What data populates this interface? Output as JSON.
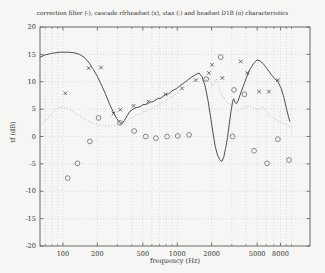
{
  "figure": {
    "title": "correction filter (-), cascade rfrheadset (x), stax (:) and headset D1B (o) characteristics",
    "xlabel": "frequency (Hz)",
    "ylabel": "tf (dB)"
  },
  "chart_data": {
    "type": "line",
    "title": "correction filter (-), cascade rfrheadset (x), stax (:) and headset D1B (o) characteristics",
    "xlabel": "frequency (Hz)",
    "ylabel": "tf (dB)",
    "x_scale": "log",
    "xlim": [
      63,
      14500
    ],
    "ylim": [
      -20,
      20
    ],
    "x_ticks": [
      100,
      200,
      500,
      1000,
      2000,
      5000,
      8000
    ],
    "x_minor_ticks": [
      70,
      80,
      90,
      300,
      400,
      600,
      700,
      800,
      900,
      3000,
      4000,
      6000,
      7000,
      9000,
      10000
    ],
    "y_ticks": [
      -20,
      -15,
      -10,
      -5,
      0,
      5,
      10,
      15,
      20
    ],
    "grid": true,
    "legend_position": "in-title",
    "colors": {
      "frame": "#5a5a5a",
      "grid": "#cccccc",
      "tick_text": "#333333"
    },
    "series": [
      {
        "name": "correction filter",
        "style": "solid-line",
        "color": "#3c3c3c",
        "points": [
          [
            63,
            14.5
          ],
          [
            70,
            14.9
          ],
          [
            80,
            15.2
          ],
          [
            95,
            15.4
          ],
          [
            110,
            15.4
          ],
          [
            125,
            15.3
          ],
          [
            140,
            15.0
          ],
          [
            155,
            14.4
          ],
          [
            170,
            13.4
          ],
          [
            185,
            12.2
          ],
          [
            200,
            11.0
          ],
          [
            215,
            9.6
          ],
          [
            235,
            7.8
          ],
          [
            255,
            6.0
          ],
          [
            275,
            4.5
          ],
          [
            295,
            3.3
          ],
          [
            315,
            2.5
          ],
          [
            330,
            2.4
          ],
          [
            345,
            2.9
          ],
          [
            365,
            3.8
          ],
          [
            385,
            4.6
          ],
          [
            410,
            5.0
          ],
          [
            440,
            5.3
          ],
          [
            470,
            5.4
          ],
          [
            500,
            5.8
          ],
          [
            540,
            5.9
          ],
          [
            580,
            6.3
          ],
          [
            620,
            6.4
          ],
          [
            670,
            6.9
          ],
          [
            720,
            7.0
          ],
          [
            780,
            7.6
          ],
          [
            840,
            7.8
          ],
          [
            910,
            8.4
          ],
          [
            980,
            8.7
          ],
          [
            1060,
            9.3
          ],
          [
            1150,
            9.8
          ],
          [
            1250,
            10.4
          ],
          [
            1350,
            10.9
          ],
          [
            1450,
            11.3
          ],
          [
            1550,
            11.6
          ],
          [
            1650,
            10.9
          ],
          [
            1750,
            9.3
          ],
          [
            1850,
            6.8
          ],
          [
            1950,
            3.8
          ],
          [
            2050,
            0.8
          ],
          [
            2150,
            -1.8
          ],
          [
            2250,
            -3.4
          ],
          [
            2350,
            -4.2
          ],
          [
            2450,
            -4.6
          ],
          [
            2550,
            -3.8
          ],
          [
            2650,
            -2.2
          ],
          [
            2750,
            -0.2
          ],
          [
            2850,
            2.2
          ],
          [
            2950,
            4.6
          ],
          [
            3050,
            6.4
          ],
          [
            3120,
            6.9
          ],
          [
            3200,
            6.2
          ],
          [
            3300,
            6.0
          ],
          [
            3400,
            6.5
          ],
          [
            3550,
            7.6
          ],
          [
            3750,
            9.0
          ],
          [
            4000,
            10.6
          ],
          [
            4300,
            12.2
          ],
          [
            4650,
            13.3
          ],
          [
            5000,
            14.0
          ],
          [
            5300,
            13.8
          ],
          [
            5700,
            13.2
          ],
          [
            6100,
            12.4
          ],
          [
            6600,
            11.4
          ],
          [
            7100,
            10.6
          ],
          [
            7600,
            10.0
          ],
          [
            8100,
            8.8
          ],
          [
            8600,
            7.0
          ],
          [
            9000,
            5.2
          ],
          [
            9400,
            3.6
          ],
          [
            9700,
            2.7
          ]
        ]
      },
      {
        "name": "cascade rfrheadset",
        "style": "x-markers",
        "color": "#4a4a4a",
        "points": [
          [
            105,
            7.9
          ],
          [
            168,
            12.5
          ],
          [
            215,
            12.6
          ],
          [
            277,
            4.2
          ],
          [
            318,
            4.9
          ],
          [
            415,
            5.6
          ],
          [
            560,
            6.4
          ],
          [
            790,
            7.7
          ],
          [
            1100,
            8.8
          ],
          [
            1450,
            10.3
          ],
          [
            1890,
            11.6
          ],
          [
            2020,
            13.1
          ],
          [
            2480,
            10.7
          ],
          [
            3590,
            13.7
          ],
          [
            4100,
            11.6
          ],
          [
            5200,
            8.2
          ],
          [
            6340,
            8.2
          ],
          [
            7580,
            10.3
          ]
        ]
      },
      {
        "name": "stax",
        "style": "dotted-line",
        "color": "#b4b4b0",
        "points": [
          [
            63,
            1.8
          ],
          [
            75,
            3.5
          ],
          [
            88,
            5.2
          ],
          [
            100,
            5.4
          ],
          [
            115,
            4.9
          ],
          [
            140,
            3.7
          ],
          [
            170,
            2.7
          ],
          [
            210,
            2.0
          ],
          [
            260,
            1.9
          ],
          [
            320,
            2.2
          ],
          [
            400,
            3.4
          ],
          [
            500,
            4.4
          ],
          [
            630,
            5.3
          ],
          [
            800,
            6.6
          ],
          [
            1000,
            8.0
          ],
          [
            1200,
            9.2
          ],
          [
            1400,
            10.2
          ],
          [
            1600,
            10.6
          ],
          [
            1750,
            9.8
          ],
          [
            1900,
            10.8
          ],
          [
            2050,
            9.3
          ],
          [
            2200,
            10.5
          ],
          [
            2400,
            8.0
          ],
          [
            2700,
            6.3
          ],
          [
            3000,
            5.6
          ],
          [
            3400,
            4.6
          ],
          [
            3800,
            5.3
          ],
          [
            4300,
            5.6
          ],
          [
            5000,
            4.8
          ],
          [
            5600,
            5.5
          ],
          [
            6300,
            4.0
          ],
          [
            7100,
            3.2
          ],
          [
            8000,
            2.6
          ],
          [
            9000,
            2.2
          ],
          [
            10000,
            1.5
          ]
        ]
      },
      {
        "name": "headset D1B",
        "style": "o-markers",
        "color": "#6b6b6b",
        "points": [
          [
            110,
            -7.6
          ],
          [
            134,
            -4.9
          ],
          [
            172,
            -0.9
          ],
          [
            205,
            3.4
          ],
          [
            316,
            2.5
          ],
          [
            420,
            1.0
          ],
          [
            530,
            0.0
          ],
          [
            650,
            -0.3
          ],
          [
            815,
            0.0
          ],
          [
            1010,
            0.1
          ],
          [
            1270,
            0.3
          ],
          [
            1790,
            10.5
          ],
          [
            2400,
            14.5
          ],
          [
            3050,
            0.0
          ],
          [
            3140,
            8.5
          ],
          [
            3870,
            7.7
          ],
          [
            4700,
            -2.6
          ],
          [
            6100,
            -4.9
          ],
          [
            7600,
            -0.5
          ],
          [
            9500,
            -4.3
          ]
        ]
      }
    ]
  }
}
